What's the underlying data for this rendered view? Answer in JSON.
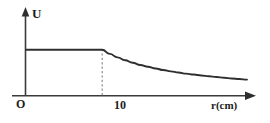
{
  "figure": {
    "name": "potential-vs-radius-graph",
    "background_color": "#ffffff",
    "line_color": "#2f2f2f",
    "axis_color": "#3a3a3a",
    "guide_color": "#8d8d8d"
  },
  "labels": {
    "y_axis": "U",
    "x_axis": "r(cm)",
    "origin": "O",
    "tick_10": "10"
  },
  "chart_data": {
    "type": "line",
    "title": "",
    "xlabel": "r(cm)",
    "ylabel": "U",
    "grid": false,
    "legend": null,
    "xlim": [
      0,
      29
    ],
    "ylim": [
      0,
      10
    ],
    "x_ticks": [
      0,
      10
    ],
    "x_tick_labels": [
      "O",
      "10"
    ],
    "y_ticks": [],
    "y_tick_labels": [],
    "annotations": [
      {
        "name": "dashed-guide-at-r-10",
        "type": "vertical-dashed-line",
        "x": 10,
        "y_from": 0,
        "y_to": 6.2
      }
    ],
    "series": [
      {
        "name": "U(r)",
        "description": "Constant potential inside r = 10 cm, then 1/r decay outside",
        "x": [
          0,
          2,
          4,
          6,
          8,
          10,
          11,
          12,
          13,
          14,
          15,
          16,
          17,
          18,
          19,
          20,
          21,
          22,
          23,
          24,
          25,
          26,
          27,
          28,
          29
        ],
        "y": [
          6.2,
          6.2,
          6.2,
          6.2,
          6.2,
          6.2,
          5.64,
          5.17,
          4.77,
          4.43,
          4.13,
          3.88,
          3.65,
          3.44,
          3.26,
          3.1,
          2.95,
          2.82,
          2.7,
          2.58,
          2.48,
          2.38,
          2.29,
          2.21,
          2.13
        ]
      }
    ]
  }
}
